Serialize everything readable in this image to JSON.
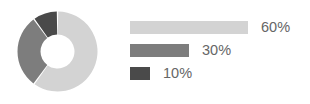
{
  "chart_data": {
    "type": "pie",
    "variant": "donut",
    "title": "",
    "subtitle": "",
    "xlabel": "",
    "ylabel": "",
    "grid": false,
    "legend_position": "right",
    "legend_style": "proportional-bars",
    "units": "percent",
    "total": 100,
    "start_angle_deg": 0,
    "direction": "clockwise",
    "inner_radius_ratio": 0.42,
    "labels": [
      "60%",
      "30%",
      "10%"
    ],
    "values": [
      60,
      30,
      10
    ],
    "colors": [
      "#d3d3d3",
      "#7d7d7d",
      "#4a4a4a"
    ],
    "slices": [
      {
        "label": "60%",
        "value": 60,
        "color": "#d3d3d3",
        "bar_width_px": 118
      },
      {
        "label": "30%",
        "value": 30,
        "color": "#7d7d7d",
        "bar_width_px": 59
      },
      {
        "label": "10%",
        "value": 10,
        "color": "#4a4a4a",
        "bar_width_px": 20
      }
    ]
  },
  "donut": {
    "name": "donut-chart",
    "center_x": 40.5,
    "center_y": 40.5,
    "outer_radius": 40,
    "inner_radius": 17,
    "gap_deg": 2,
    "background": "#ffffff"
  },
  "legend": {
    "rows": [
      {
        "label": "60%",
        "value": 60,
        "color": "#d3d3d3",
        "bar_width_px": 118
      },
      {
        "label": "30%",
        "value": 30,
        "color": "#7d7d7d",
        "bar_width_px": 59
      },
      {
        "label": "10%",
        "value": 10,
        "color": "#4a4a4a",
        "bar_width_px": 20
      }
    ],
    "text_color": "#666666"
  },
  "canvas": {
    "width": 310,
    "height": 104,
    "background": "#ffffff"
  }
}
